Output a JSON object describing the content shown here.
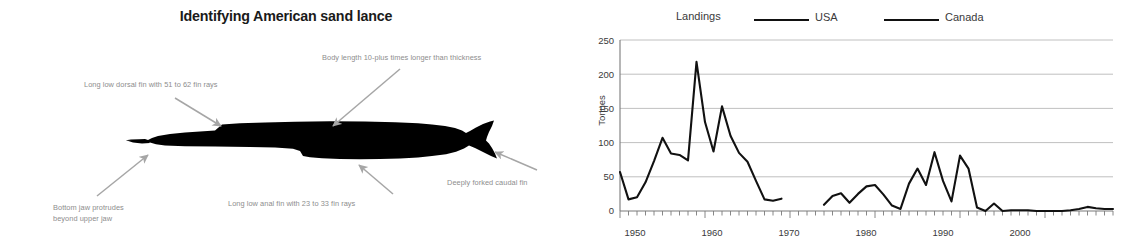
{
  "diagram": {
    "title": "Identifying American sand lance",
    "subject_icon": "sand-lance-fish-silhouette",
    "annotations": [
      {
        "id": "dorsal-fin",
        "text": "Long low dorsal fin with 51 to 62 fin rays"
      },
      {
        "id": "body-length",
        "text": "Body length 10-plus times longer than thickness"
      },
      {
        "id": "bottom-jaw",
        "text": "Bottom jaw protrudes\nbeyond upper jaw"
      },
      {
        "id": "anal-fin",
        "text": "Long low anal fin with 23 to 33 fin rays"
      },
      {
        "id": "caudal-fin",
        "text": "Deeply forked caudal fin"
      }
    ],
    "colors": {
      "fish": "#000000",
      "arrow": "#a6a6a6",
      "label": "#8d8d8d",
      "title": "#1a1a1a"
    }
  },
  "chart_data": {
    "type": "line",
    "title": "Landings",
    "xlabel": "",
    "ylabel": "Tonnes",
    "xlim": [
      1950,
      2008
    ],
    "ylim": [
      0,
      250
    ],
    "yticks": [
      0,
      50,
      100,
      150,
      200,
      250
    ],
    "xticks": [
      1950,
      1960,
      1970,
      1980,
      1990,
      2000
    ],
    "grid": "horizontal",
    "legend_position": "top",
    "minor_ticks": "annual",
    "colors": {
      "line": "#111111",
      "grid": "#b9b9b9",
      "axis": "#7a7a7a",
      "text": "#3a3a3a"
    },
    "series": [
      {
        "name": "USA",
        "x": [
          1950,
          1951,
          1952,
          1953,
          1954,
          1955,
          1956,
          1957,
          1958,
          1959,
          1960,
          1961,
          1962,
          1963,
          1964,
          1965,
          1966,
          1967,
          1968,
          1969,
          1974,
          1975,
          1976,
          1977,
          1978,
          1979,
          1980,
          1981,
          1982,
          1983,
          1984,
          1985,
          1986,
          1987,
          1988,
          1989,
          1990,
          1991,
          1992,
          1993,
          1994,
          1995,
          1996,
          1997,
          1998,
          1999,
          2000,
          2001,
          2002,
          2003,
          2004,
          2005,
          2006,
          2007,
          2008
        ],
        "values": [
          57,
          17,
          20,
          42,
          73,
          107,
          84,
          82,
          74,
          218,
          130,
          87,
          153,
          110,
          85,
          72,
          44,
          17,
          15,
          18,
          9,
          22,
          26,
          12,
          25,
          36,
          38,
          24,
          8,
          3,
          40,
          62,
          38,
          86,
          44,
          14,
          81,
          62,
          5,
          0,
          11,
          0,
          1,
          1,
          1,
          0,
          0,
          0,
          0,
          1,
          3,
          6,
          4,
          3,
          3
        ]
      },
      {
        "name": "Canada",
        "x": [],
        "values": []
      }
    ]
  }
}
